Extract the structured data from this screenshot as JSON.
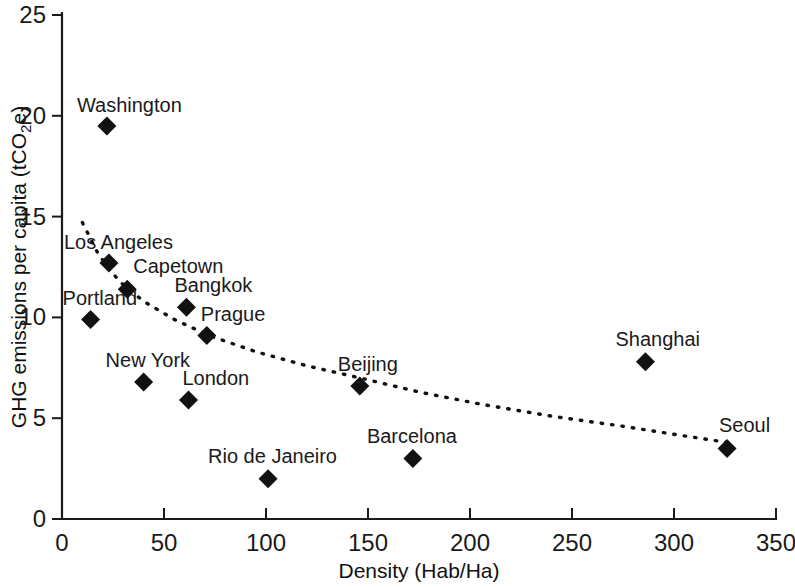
{
  "chart_data": {
    "type": "scatter",
    "title": "",
    "xlabel": "Density (Hab/Ha)",
    "ylabel_main": "GHG emissions per capita (tCO",
    "ylabel_sub": "2",
    "ylabel_tail": "e)",
    "ylabel_full": "GHG emissions per capita (tCO2e)",
    "xlim": [
      0,
      350
    ],
    "ylim": [
      0,
      25
    ],
    "xticks": [
      0,
      50,
      100,
      150,
      200,
      250,
      300,
      350
    ],
    "yticks": [
      0,
      5,
      10,
      15,
      20,
      25
    ],
    "xtick_labels": [
      "0",
      "50",
      "100",
      "150",
      "200",
      "250",
      "300",
      "350"
    ],
    "ytick_labels": [
      "0",
      "5",
      "10",
      "15",
      "20",
      "25"
    ],
    "grid": false,
    "legend": false,
    "marker": "diamond",
    "marker_color": "#111111",
    "points": [
      {
        "label": "Washington",
        "x": 22,
        "y": 19.5,
        "label_dx": -30,
        "label_dy": -14,
        "anchor": "start"
      },
      {
        "label": "Los Angeles",
        "x": 23,
        "y": 12.7,
        "label_dx": -45,
        "label_dy": -14,
        "anchor": "start"
      },
      {
        "label": "Capetown",
        "x": 32,
        "y": 11.4,
        "label_dx": 6,
        "label_dy": -16,
        "anchor": "start"
      },
      {
        "label": "Portland",
        "x": 14,
        "y": 9.9,
        "label_dx": -28,
        "label_dy": -14,
        "anchor": "start"
      },
      {
        "label": "Bangkok",
        "x": 61,
        "y": 10.5,
        "label_dx": -12,
        "label_dy": -15,
        "anchor": "start"
      },
      {
        "label": "Prague",
        "x": 71,
        "y": 9.1,
        "label_dx": -6,
        "label_dy": -15,
        "anchor": "start"
      },
      {
        "label": "New York",
        "x": 40,
        "y": 6.8,
        "label_dx": -38,
        "label_dy": -15,
        "anchor": "start"
      },
      {
        "label": "London",
        "x": 62,
        "y": 5.9,
        "label_dx": -6,
        "label_dy": -15,
        "anchor": "start"
      },
      {
        "label": "Rio de Janeiro",
        "x": 101,
        "y": 2.0,
        "label_dx": -60,
        "label_dy": -16,
        "anchor": "start"
      },
      {
        "label": "Beijing",
        "x": 146,
        "y": 6.6,
        "label_dx": -22,
        "label_dy": -15,
        "anchor": "start"
      },
      {
        "label": "Barcelona",
        "x": 172,
        "y": 3.0,
        "label_dx": -46,
        "label_dy": -16,
        "anchor": "start"
      },
      {
        "label": "Shanghai",
        "x": 286,
        "y": 7.8,
        "label_dx": -30,
        "label_dy": -16,
        "anchor": "start"
      },
      {
        "label": "Seoul",
        "x": 326,
        "y": 3.5,
        "label_dx": -8,
        "label_dy": -16,
        "anchor": "start"
      }
    ],
    "trend": {
      "style": "dotted",
      "description": "decreasing power-law fit",
      "points": [
        {
          "x": 10,
          "y": 14.7
        },
        {
          "x": 18,
          "y": 13.1
        },
        {
          "x": 28,
          "y": 11.8
        },
        {
          "x": 40,
          "y": 10.8
        },
        {
          "x": 55,
          "y": 9.9
        },
        {
          "x": 72,
          "y": 9.1
        },
        {
          "x": 95,
          "y": 8.3
        },
        {
          "x": 120,
          "y": 7.6
        },
        {
          "x": 146,
          "y": 7.0
        },
        {
          "x": 175,
          "y": 6.3
        },
        {
          "x": 205,
          "y": 5.7
        },
        {
          "x": 240,
          "y": 5.1
        },
        {
          "x": 275,
          "y": 4.6
        },
        {
          "x": 300,
          "y": 4.2
        },
        {
          "x": 326,
          "y": 3.8
        }
      ]
    }
  }
}
